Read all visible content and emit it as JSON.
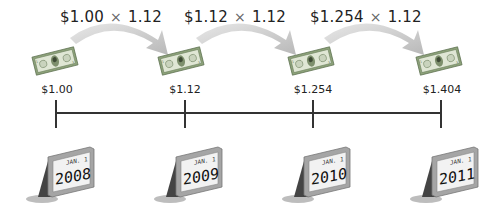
{
  "diagram": {
    "type": "compound-growth-timeline",
    "rate_multiplier": "1.12",
    "formulas": [
      {
        "base": "$1.00",
        "op": "×",
        "factor": "1.12"
      },
      {
        "base": "$1.12",
        "op": "×",
        "factor": "1.12"
      },
      {
        "base": "$1.254",
        "op": "×",
        "factor": "1.12"
      }
    ],
    "values": [
      "$1.00",
      "$1.12",
      "$1.254",
      "$1.404"
    ],
    "dates": [
      {
        "label": "JAN. 1",
        "year": "2008"
      },
      {
        "label": "JAN. 1",
        "year": "2009"
      },
      {
        "label": "JAN. 1",
        "year": "2010"
      },
      {
        "label": "JAN. 1",
        "year": "2011"
      }
    ],
    "icons": {
      "bill": "dollar-bill-icon",
      "arrow": "curved-arrow-icon",
      "calendar": "desk-calendar-icon"
    },
    "colors": {
      "bill_green": "#7f9a6a",
      "bill_light": "#dfe6d4",
      "arrow_gray": "#c8c8c8",
      "line": "#333333",
      "calendar_frame": "#9a9a9a"
    }
  }
}
